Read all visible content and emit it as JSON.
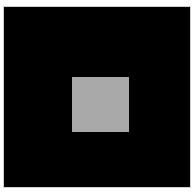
{
  "image": {
    "background_color": "#ffffff",
    "frame": {
      "color": "#000000",
      "border_color": "#cfcfcf"
    },
    "center_square": {
      "color": "#a9a9a9"
    }
  }
}
